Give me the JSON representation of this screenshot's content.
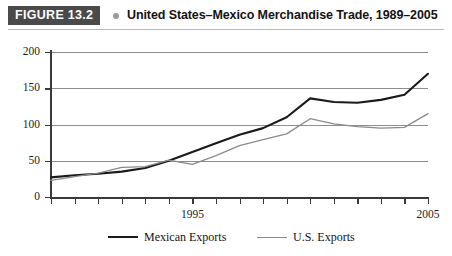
{
  "header": {
    "figure_badge": "FIGURE 13.2",
    "title": "United States–Mexico Merchandise Trade, 1989–2005",
    "badge_bg": "#4a4a4a",
    "dot_color": "#9a9a9a"
  },
  "legend": [
    {
      "label": "Mexican Exports",
      "color": "#1a1a1a"
    },
    {
      "label": "U.S. Exports",
      "color": "#8a8a8a"
    }
  ],
  "axis": {
    "y_ticks": [
      "0",
      "50",
      "100",
      "150",
      "200"
    ],
    "x_labels": [
      "1995",
      "2005"
    ]
  },
  "chart_data": {
    "type": "line",
    "title": "United States–Mexico Merchandise Trade, 1989–2005",
    "xlabel": "",
    "ylabel": "",
    "ylim": [
      0,
      200
    ],
    "xlim": [
      1989,
      2005
    ],
    "grid": true,
    "legend_position": "bottom",
    "x": [
      1989,
      1990,
      1991,
      1992,
      1993,
      1994,
      1995,
      1996,
      1997,
      1998,
      1999,
      2000,
      2001,
      2002,
      2003,
      2004,
      2005
    ],
    "series": [
      {
        "name": "Mexican Exports",
        "color": "#1a1a1a",
        "values": [
          27,
          30,
          32,
          35,
          40,
          50,
          62,
          74,
          86,
          95,
          110,
          136,
          131,
          130,
          134,
          141,
          170
        ]
      },
      {
        "name": "U.S. Exports",
        "color": "#8a8a8a",
        "values": [
          23,
          28,
          33,
          41,
          42,
          51,
          45,
          57,
          71,
          79,
          87,
          108,
          101,
          97,
          95,
          96,
          115
        ]
      }
    ]
  }
}
